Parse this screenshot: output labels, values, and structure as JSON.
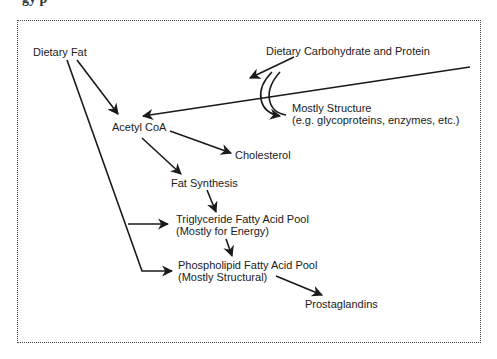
{
  "heading_fragment": "gy  p",
  "nodes": {
    "dietary_fat": "Dietary Fat",
    "dietary_carb_protein": "Dietary Carbohydrate and Protein",
    "mostly_structure": [
      "Mostly Structure",
      "(e.g. glycoproteins, enzymes, etc.)"
    ],
    "acetyl_coa": "Acetyl CoA",
    "cholesterol": "Cholesterol",
    "fat_synthesis": "Fat Synthesis",
    "triglyceride_pool": [
      "Triglyceride Fatty Acid Pool",
      "(Mostly for Energy)"
    ],
    "phospholipid_pool": [
      "Phospholipid Fatty Acid Pool",
      "(Mostly Structural)"
    ],
    "prostaglandins": "Prostaglandins"
  },
  "edges": [
    {
      "from": "Dietary Fat",
      "to": "Acetyl CoA"
    },
    {
      "from": "Dietary Fat",
      "to": "Triglyceride Fatty Acid Pool"
    },
    {
      "from": "Dietary Fat",
      "to": "Phospholipid Fatty Acid Pool"
    },
    {
      "from": "Dietary Carbohydrate and Protein",
      "to": "Acetyl CoA"
    },
    {
      "from": "Dietary Carbohydrate and Protein",
      "to": "Mostly Structure"
    },
    {
      "from": "Acetyl CoA",
      "to": "Cholesterol"
    },
    {
      "from": "Acetyl CoA",
      "to": "Fat Synthesis"
    },
    {
      "from": "Fat Synthesis",
      "to": "Triglyceride Fatty Acid Pool"
    },
    {
      "from": "Triglyceride Fatty Acid Pool",
      "to": "Phospholipid Fatty Acid Pool"
    },
    {
      "from": "Phospholipid Fatty Acid Pool",
      "to": "Prostaglandins"
    }
  ]
}
